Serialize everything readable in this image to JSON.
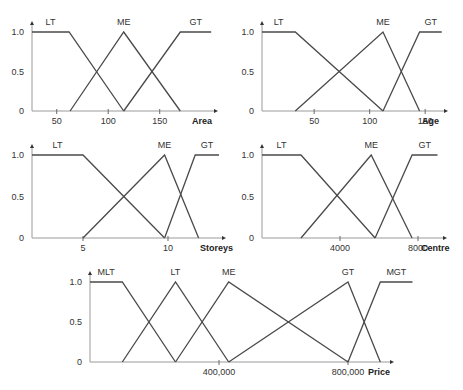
{
  "chart_data": [
    {
      "type": "line",
      "title": "",
      "xlabel": "Area",
      "ylabel": "",
      "ylim": [
        0,
        1.0
      ],
      "y_ticks": [
        "0",
        "0.5",
        "1.0"
      ],
      "x_ticks": [
        {
          "value": 50,
          "label": "50"
        },
        {
          "value": 100,
          "label": "100"
        },
        {
          "value": 150,
          "label": "150"
        }
      ],
      "xlim": [
        26,
        200
      ],
      "grid": false,
      "series": [
        {
          "name": "LT",
          "points": [
            [
              26,
              1
            ],
            [
              62,
              1
            ],
            [
              115,
              0
            ]
          ]
        },
        {
          "name": "ME",
          "points": [
            [
              63,
              0
            ],
            [
              115,
              1
            ],
            [
              170,
              0
            ]
          ]
        },
        {
          "name": "GT",
          "points": [
            [
              115,
              0
            ],
            [
              170,
              1
            ],
            [
              200,
              1
            ]
          ]
        }
      ]
    },
    {
      "type": "line",
      "title": "",
      "xlabel": "Age",
      "ylabel": "",
      "ylim": [
        0,
        1.0
      ],
      "y_ticks": [
        "0",
        "0.5",
        "1.0"
      ],
      "x_ticks": [
        {
          "value": 50,
          "label": "50"
        },
        {
          "value": 100,
          "label": "100"
        },
        {
          "value": 150,
          "label": "150"
        }
      ],
      "xlim": [
        3,
        165
      ],
      "grid": false,
      "series": [
        {
          "name": "LT",
          "points": [
            [
              3,
              1
            ],
            [
              33,
              1
            ],
            [
              112,
              0
            ]
          ]
        },
        {
          "name": "ME",
          "points": [
            [
              33,
              0
            ],
            [
              112,
              1
            ],
            [
              145,
              0
            ]
          ]
        },
        {
          "name": "GT",
          "points": [
            [
              112,
              0
            ],
            [
              145,
              1
            ],
            [
              165,
              1
            ]
          ]
        }
      ]
    },
    {
      "type": "line",
      "title": "",
      "xlabel": "Storeys",
      "ylabel": "",
      "ylim": [
        0,
        1.0
      ],
      "y_ticks": [
        "0",
        "0.5",
        "1.0"
      ],
      "x_ticks": [
        {
          "value": 5,
          "label": "5"
        },
        {
          "value": 10,
          "label": "10"
        }
      ],
      "xlim": [
        2,
        13
      ],
      "grid": false,
      "series": [
        {
          "name": "LT",
          "points": [
            [
              2,
              1
            ],
            [
              5,
              1
            ],
            [
              9.8,
              0
            ]
          ]
        },
        {
          "name": "ME",
          "points": [
            [
              5,
              0
            ],
            [
              9.8,
              1
            ],
            [
              11.8,
              0
            ]
          ]
        },
        {
          "name": "GT",
          "points": [
            [
              9.8,
              0
            ],
            [
              11.6,
              1
            ],
            [
              13,
              1
            ]
          ]
        }
      ]
    },
    {
      "type": "line",
      "title": "",
      "xlabel": "Centre",
      "ylabel": "",
      "ylim": [
        0,
        1.0
      ],
      "y_ticks": [
        "0",
        "0.5",
        "1.0"
      ],
      "x_ticks": [
        {
          "value": 4000,
          "label": "4000"
        },
        {
          "value": 8000,
          "label": "8000"
        }
      ],
      "xlim": [
        0,
        9000
      ],
      "grid": false,
      "series": [
        {
          "name": "LT",
          "points": [
            [
              0,
              1
            ],
            [
              2000,
              1
            ],
            [
              5800,
              0
            ]
          ]
        },
        {
          "name": "ME",
          "points": [
            [
              2000,
              0
            ],
            [
              5600,
              1
            ],
            [
              7700,
              0
            ]
          ]
        },
        {
          "name": "GT",
          "points": [
            [
              5800,
              0
            ],
            [
              7700,
              1
            ],
            [
              9000,
              1
            ]
          ]
        }
      ]
    },
    {
      "type": "line",
      "title": "",
      "xlabel": "Price",
      "ylabel": "",
      "ylim": [
        0,
        1.0
      ],
      "y_ticks": [
        "0",
        "0.5",
        "1.0"
      ],
      "x_ticks": [
        {
          "value": 400000,
          "label": "400,000"
        },
        {
          "value": 800000,
          "label": "800,000"
        }
      ],
      "xlim": [
        0,
        1000000
      ],
      "grid": false,
      "series": [
        {
          "name": "MLT",
          "points": [
            [
              0,
              1
            ],
            [
              100000,
              1
            ],
            [
              265000,
              0
            ]
          ]
        },
        {
          "name": "LT",
          "points": [
            [
              100000,
              0
            ],
            [
              265000,
              1
            ],
            [
              430000,
              0
            ]
          ]
        },
        {
          "name": "ME",
          "points": [
            [
              265000,
              0
            ],
            [
              430000,
              1
            ],
            [
              800000,
              0
            ]
          ]
        },
        {
          "name": "GT",
          "points": [
            [
              430000,
              0
            ],
            [
              800000,
              1
            ],
            [
              900000,
              0
            ]
          ]
        },
        {
          "name": "MGT",
          "points": [
            [
              800000,
              0
            ],
            [
              900000,
              1
            ],
            [
              1000000,
              1
            ]
          ]
        }
      ]
    }
  ]
}
